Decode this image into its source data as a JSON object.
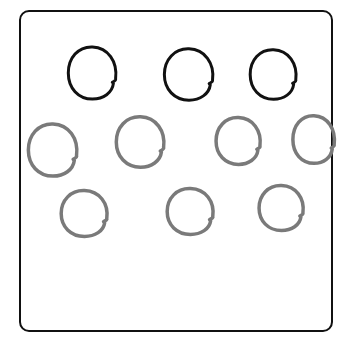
{
  "canvas": {
    "width": 338,
    "height": 337,
    "background": "#ffffff"
  },
  "frame": {
    "stroke": "#111111"
  },
  "colors": {
    "dark": "#111111",
    "gray": "#7a7a7a"
  },
  "circles": [
    {
      "id": "dark-1",
      "tone": "dark",
      "x": 65,
      "y": 44,
      "w": 55,
      "h": 58
    },
    {
      "id": "dark-2",
      "tone": "dark",
      "x": 161,
      "y": 46,
      "w": 56,
      "h": 57
    },
    {
      "id": "dark-3",
      "tone": "dark",
      "x": 247,
      "y": 47,
      "w": 53,
      "h": 55
    },
    {
      "id": "gray-1",
      "tone": "gray",
      "x": 25,
      "y": 121,
      "w": 56,
      "h": 58
    },
    {
      "id": "gray-2",
      "tone": "gray",
      "x": 113,
      "y": 114,
      "w": 55,
      "h": 56
    },
    {
      "id": "gray-3",
      "tone": "gray",
      "x": 213,
      "y": 115,
      "w": 51,
      "h": 52
    },
    {
      "id": "gray-4",
      "tone": "gray",
      "x": 290,
      "y": 113,
      "w": 48,
      "h": 53
    },
    {
      "id": "gray-5",
      "tone": "gray",
      "x": 58,
      "y": 188,
      "w": 53,
      "h": 51
    },
    {
      "id": "gray-6",
      "tone": "gray",
      "x": 164,
      "y": 186,
      "w": 53,
      "h": 51
    },
    {
      "id": "gray-7",
      "tone": "gray",
      "x": 256,
      "y": 183,
      "w": 51,
      "h": 50
    }
  ]
}
